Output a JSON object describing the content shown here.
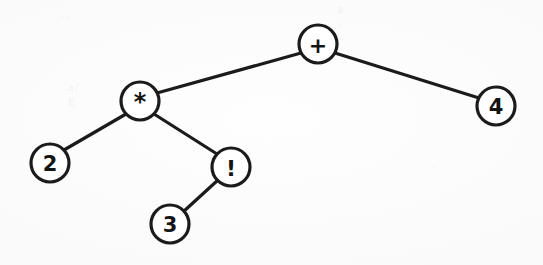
{
  "diagram": {
    "type": "binary-expression-tree",
    "expression": "2 * 3! + 4",
    "background_color": "#fefefe",
    "stroke_color": "#1b1b1b",
    "node_fill_color": "#ffffff",
    "node_radius": 19,
    "edge_width": 3.2,
    "node_stroke_width": 3.2,
    "label_font_size": 21
  },
  "nodes": [
    {
      "id": "plus",
      "label": "+",
      "name": "node-plus",
      "role": "root",
      "x": 318,
      "y": 44,
      "font_size": 22
    },
    {
      "id": "times",
      "label": "*",
      "name": "node-times",
      "role": "internal",
      "x": 140,
      "y": 101,
      "font_size": 24
    },
    {
      "id": "four",
      "label": "4",
      "name": "node-four",
      "role": "leaf",
      "x": 496,
      "y": 106,
      "font_size": 21
    },
    {
      "id": "two",
      "label": "2",
      "name": "node-two",
      "role": "leaf",
      "x": 50,
      "y": 163,
      "font_size": 21
    },
    {
      "id": "bang",
      "label": "!",
      "name": "node-factorial",
      "role": "internal",
      "x": 231,
      "y": 167,
      "font_size": 22
    },
    {
      "id": "three",
      "label": "3",
      "name": "node-three",
      "role": "leaf",
      "x": 170,
      "y": 224,
      "font_size": 21
    }
  ],
  "edges": [
    {
      "id": "plus-times",
      "name": "edge-plus-to-times",
      "from": "plus",
      "to": "times",
      "x1": 301,
      "y1": 53,
      "x2": 157,
      "y2": 93
    },
    {
      "id": "plus-four",
      "name": "edge-plus-to-four",
      "from": "plus",
      "to": "four",
      "x1": 335,
      "y1": 53,
      "x2": 479,
      "y2": 98
    },
    {
      "id": "times-two",
      "name": "edge-times-to-two",
      "from": "times",
      "to": "two",
      "x1": 126,
      "y1": 114,
      "x2": 64,
      "y2": 150
    },
    {
      "id": "times-bang",
      "name": "edge-times-to-factorial",
      "from": "times",
      "to": "bang",
      "x1": 154,
      "y1": 114,
      "x2": 217,
      "y2": 154
    },
    {
      "id": "bang-three",
      "name": "edge-factorial-to-three",
      "from": "bang",
      "to": "three",
      "x1": 218,
      "y1": 180,
      "x2": 183,
      "y2": 212
    }
  ],
  "artifacts": [
    {
      "name": "scan-artifact-top-left",
      "text": "··",
      "x": 60,
      "y": 10
    },
    {
      "name": "scan-artifact-left",
      "text": "a/  E",
      "x": 68,
      "y": 80
    },
    {
      "name": "scan-artifact-top-right",
      "text": "a  · ·",
      "x": 338,
      "y": 2
    },
    {
      "name": "scan-artifact-right",
      "text": "· ·",
      "x": 430,
      "y": 8
    },
    {
      "name": "scan-artifact-mid-right",
      "text": "·",
      "x": 470,
      "y": 82
    },
    {
      "name": "scan-artifact-bottom",
      "text": "·",
      "x": 432,
      "y": 160
    },
    {
      "name": "scan-artifact-bottom-left",
      "text": "·",
      "x": 22,
      "y": 240
    }
  ]
}
